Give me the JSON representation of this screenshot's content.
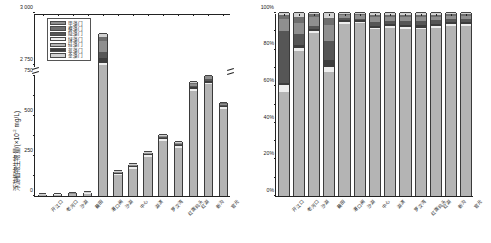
{
  "figure": {
    "panels": [
      "a",
      "b"
    ]
  },
  "legend": {
    "items": [
      {
        "label": "甲藻门",
        "color": "#8f8f8f"
      },
      {
        "label": "裸藻门",
        "color": "#6e6e6e"
      },
      {
        "label": "隐藻门",
        "color": "#565656"
      },
      {
        "label": "绿藻门",
        "color": "#eeeeee"
      },
      {
        "label": "硅藻门",
        "color": "#b4b4b4"
      },
      {
        "label": "蓝藻门",
        "color": "#3d3d3d"
      },
      {
        "label": "金藻门",
        "color": "#d2d2d2"
      }
    ]
  },
  "chart_data": [
    {
      "type": "bar",
      "id": "panel-a",
      "title": "",
      "stacked": true,
      "xlabel": "",
      "ylabel": "浮游植物生物量/(×10⁻² mg/L)",
      "ylim": [
        0,
        3000
      ],
      "axis_break": {
        "from": 750,
        "to": 2750
      },
      "yticks": [
        0,
        250,
        500,
        750,
        2750,
        3000
      ],
      "ytick_labels": [
        "0",
        "250",
        "500",
        "750",
        "2 750",
        "3 000"
      ],
      "grid": false,
      "legend_position": "upper-left",
      "categories": [
        "开江口",
        "老河口",
        "沙湖",
        "藕田",
        "港口闸",
        "沙湖",
        "中心",
        "湖滨",
        "罗汉湾",
        "红旗码头",
        "红湖",
        "新沟",
        "官元"
      ],
      "series": [
        {
          "name": "硅藻门",
          "values": [
            5.5,
            8.0,
            12.0,
            14.0,
            2730,
            130,
            170,
            245,
            345,
            300,
            655,
            700,
            545
          ]
        },
        {
          "name": "绿藻门",
          "values": [
            2.0,
            1.5,
            2.0,
            2.5,
            30,
            8,
            10,
            10,
            12,
            14,
            12,
            10,
            10
          ]
        },
        {
          "name": "蓝藻门",
          "values": [
            0.6,
            0.6,
            0.8,
            1.2,
            24,
            4,
            5,
            5,
            7,
            7,
            14,
            12,
            8
          ]
        },
        {
          "name": "隐藻门",
          "values": [
            0.5,
            0.5,
            0.6,
            0.8,
            30,
            3,
            4,
            4,
            5,
            5,
            8,
            12,
            6
          ]
        },
        {
          "name": "甲藻门",
          "values": [
            0.3,
            0.3,
            0.4,
            0.5,
            50,
            3,
            3,
            4,
            5,
            5,
            12,
            14,
            8
          ]
        },
        {
          "name": "裸藻门",
          "values": [
            0.2,
            0.2,
            0.2,
            0.3,
            20,
            2,
            2,
            2,
            3,
            3,
            6,
            6,
            4
          ]
        },
        {
          "name": "金藻门",
          "values": [
            0.1,
            0.1,
            0.1,
            0.2,
            16,
            1,
            1,
            2,
            2,
            2,
            5,
            5,
            3
          ]
        }
      ]
    },
    {
      "type": "bar",
      "id": "panel-b",
      "title": "",
      "stacked": true,
      "normalized": true,
      "xlabel": "",
      "ylabel": "",
      "ylim": [
        0,
        100
      ],
      "yticks": [
        0,
        20,
        40,
        60,
        80,
        100
      ],
      "ytick_labels": [
        "0%",
        "20%",
        "40%",
        "60%",
        "80%",
        "100%"
      ],
      "grid": false,
      "categories": [
        "开江口",
        "老河口",
        "沙湖",
        "藕田",
        "港口闸",
        "沙湖",
        "中心",
        "湖滨",
        "罗汉湾",
        "红旗码头",
        "红湖",
        "新沟",
        "官元"
      ],
      "series": [
        {
          "name": "硅藻门",
          "values": [
            57.0,
            79.0,
            89.0,
            68.0,
            94.0,
            94.5,
            91.0,
            92.0,
            91.0,
            91.0,
            92.0,
            93.0,
            93.0
          ]
        },
        {
          "name": "绿藻门",
          "values": [
            3.5,
            2.0,
            1.0,
            2.5,
            1.0,
            0.8,
            1.0,
            1.0,
            1.2,
            1.0,
            1.0,
            1.0,
            1.0
          ]
        },
        {
          "name": "蓝藻门",
          "values": [
            1.5,
            1.5,
            1.0,
            4.0,
            1.0,
            0.7,
            1.0,
            1.0,
            1.3,
            1.2,
            1.2,
            1.0,
            1.0
          ]
        },
        {
          "name": "隐藻门",
          "values": [
            28.0,
            6.0,
            2.0,
            10.0,
            1.2,
            1.0,
            2.0,
            1.5,
            2.0,
            2.3,
            1.8,
            1.5,
            1.5
          ]
        },
        {
          "name": "甲藻门",
          "values": [
            7.0,
            6.0,
            5.0,
            9.0,
            1.6,
            1.8,
            3.0,
            2.5,
            2.5,
            2.5,
            2.0,
            2.0,
            2.0
          ]
        },
        {
          "name": "裸藻门",
          "values": [
            2.0,
            3.5,
            1.5,
            4.0,
            0.7,
            0.7,
            1.0,
            1.0,
            1.0,
            1.0,
            1.0,
            1.0,
            1.0
          ]
        },
        {
          "name": "金藻门",
          "values": [
            1.0,
            2.0,
            0.5,
            2.5,
            0.5,
            0.5,
            1.0,
            1.0,
            1.0,
            1.0,
            1.0,
            0.5,
            0.5
          ]
        }
      ]
    }
  ]
}
